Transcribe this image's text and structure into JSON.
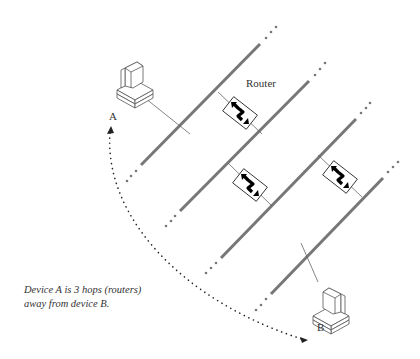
{
  "diagram": {
    "router_label": "Router",
    "device_a_label": "A",
    "device_b_label": "B",
    "caption_line1": "Device A is 3 hops (routers)",
    "caption_line2": "away from device B.",
    "hop_count": 3,
    "networks": 4,
    "routers": 3,
    "colors": {
      "network_line": "#777777",
      "router_icon": "#000000",
      "text": "#333333"
    }
  }
}
